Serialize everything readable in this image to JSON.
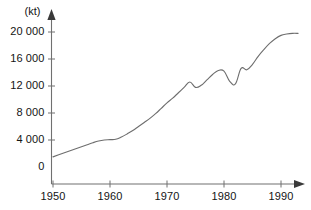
{
  "chart_data": {
    "type": "line",
    "title": "",
    "subtitle": "",
    "unit_label": "(kt)",
    "xlabel": "",
    "ylabel": "",
    "xlim": [
      1949,
      1994
    ],
    "ylim": [
      0,
      21500
    ],
    "grid": false,
    "legend": false,
    "legend_position": "none",
    "y_ticks": [
      0,
      4000,
      8000,
      12000,
      16000,
      20000
    ],
    "y_tick_labels": [
      "0",
      "4 000",
      "8 000",
      "12 000",
      "16 000",
      "20 000"
    ],
    "x_ticks": [
      1950,
      1960,
      1970,
      1980,
      1990
    ],
    "x_tick_labels": [
      "1950",
      "1960",
      "1970",
      "1980",
      "1990"
    ],
    "line_color": "#6e6e6e",
    "axis_color": "#707070",
    "series": [
      {
        "name": "Production",
        "x": [
          1950,
          1951,
          1952,
          1953,
          1954,
          1955,
          1956,
          1957,
          1958,
          1959,
          1960,
          1961,
          1962,
          1963,
          1964,
          1965,
          1966,
          1967,
          1968,
          1969,
          1970,
          1971,
          1972,
          1973,
          1974,
          1975,
          1976,
          1977,
          1978,
          1979,
          1980,
          1981,
          1982,
          1983,
          1984,
          1985,
          1986,
          1987,
          1988,
          1989,
          1990,
          1991,
          1992,
          1993
        ],
        "values": [
          1500,
          1800,
          2100,
          2400,
          2700,
          3000,
          3300,
          3600,
          3850,
          4000,
          4050,
          4100,
          4450,
          4900,
          5400,
          6000,
          6600,
          7200,
          7900,
          8700,
          9500,
          10200,
          11000,
          11800,
          12600,
          11800,
          12100,
          12900,
          13700,
          14300,
          14200,
          12700,
          12300,
          14600,
          14400,
          15200,
          16400,
          17400,
          18300,
          19000,
          19500,
          19700,
          19800,
          19800
        ]
      }
    ]
  }
}
